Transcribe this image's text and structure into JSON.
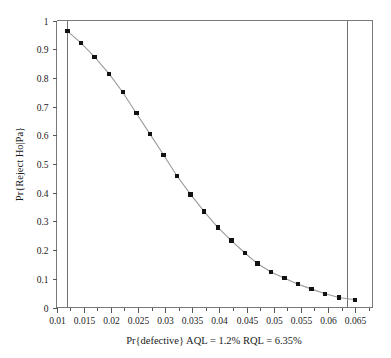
{
  "chart_data": {
    "type": "line",
    "title": "",
    "subtitle": "",
    "xlabel": "Pr{defective} AQL = 1.2% RQL = 6.35%",
    "ylabel": "Pr{Reject Ho|Pa}",
    "xlim": [
      0.01,
      0.0682
    ],
    "ylim": [
      0,
      1
    ],
    "grid": false,
    "legend_position": "none",
    "markers": "filled-square",
    "line_color": "#9a9a9a",
    "marker_color": "#121212",
    "xticks": [
      0.01,
      0.015,
      0.02,
      0.025,
      0.03,
      0.035,
      0.04,
      0.045,
      0.05,
      0.055,
      0.06,
      0.065
    ],
    "xtick_labels": [
      "0.01",
      "0.015",
      "0.02",
      "0.025",
      "0.03",
      "0.035",
      "0.04",
      "0.045",
      "0.05",
      "0.055",
      "0.06",
      "0.065"
    ],
    "xticks_minor": [
      0.0125,
      0.0175,
      0.0225,
      0.0275,
      0.0325,
      0.0375,
      0.0425,
      0.0475,
      0.0525,
      0.0575,
      0.0625,
      0.0675
    ],
    "yticks": [
      0,
      0.1,
      0.2,
      0.3,
      0.4,
      0.5,
      0.6,
      0.7,
      0.8,
      0.9,
      1
    ],
    "ytick_labels": [
      "0",
      "0.1",
      "0.2",
      "0.3",
      "0.4",
      "0.5",
      "0.6",
      "0.7",
      "0.8",
      "0.9",
      "1"
    ],
    "series": [
      {
        "name": "OC curve",
        "x": [
          0.012,
          0.0145,
          0.017,
          0.0197,
          0.0222,
          0.0247,
          0.0272,
          0.0297,
          0.0322,
          0.0347,
          0.0372,
          0.0397,
          0.0422,
          0.0447,
          0.047,
          0.0495,
          0.052,
          0.0545,
          0.057,
          0.0595,
          0.062,
          0.065
        ],
        "y": [
          0.963,
          0.922,
          0.873,
          0.814,
          0.75,
          0.677,
          0.605,
          0.532,
          0.458,
          0.394,
          0.334,
          0.279,
          0.233,
          0.19,
          0.153,
          0.124,
          0.102,
          0.081,
          0.064,
          0.048,
          0.035,
          0.027
        ]
      }
    ],
    "reference_lines": [
      {
        "name": "aql-line",
        "orientation": "vertical",
        "x": 0.012,
        "label": "AQL = 1.2%",
        "color": "#6e6e6e"
      },
      {
        "name": "rql-line",
        "orientation": "vertical",
        "x": 0.0635,
        "label": "RQL = 6.35%",
        "color": "#6e6e6e"
      }
    ]
  }
}
